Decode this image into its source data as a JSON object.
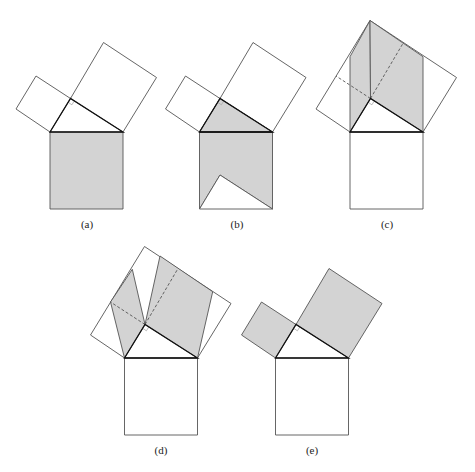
{
  "style": {
    "fill": "#d3d3d3",
    "square_stroke": "#555555",
    "triangle_stroke": "#111111",
    "dash_stroke": "#555555",
    "marker_stroke": "#aaaaaa"
  },
  "base_geometry": {
    "A": [
      50,
      132
    ],
    "B": [
      123,
      132
    ],
    "C": [
      70.5,
      98.5
    ],
    "small_square": [
      [
        50,
        132
      ],
      [
        70.5,
        98.5
      ],
      [
        36,
        76
      ],
      [
        16,
        109
      ]
    ],
    "big_square": [
      [
        70.5,
        98.5
      ],
      [
        103.5,
        42.5
      ],
      [
        156.5,
        77.5
      ],
      [
        123,
        132
      ]
    ],
    "bottom_square": [
      [
        50,
        132
      ],
      [
        123,
        132
      ],
      [
        123,
        209
      ],
      [
        50,
        209
      ]
    ],
    "outline_apex": [
      70,
      20.5
    ],
    "notch_triangle": [
      [
        50,
        209
      ],
      [
        70.5,
        175
      ],
      [
        123,
        209
      ]
    ],
    "c_left_parallelogram": [
      [
        50,
        132
      ],
      [
        70.5,
        98.5
      ],
      [
        70,
        20.5
      ],
      [
        50,
        56.7
      ]
    ],
    "c_right_parallelogram": [
      [
        70.5,
        98.5
      ],
      [
        123,
        132
      ],
      [
        123,
        56.7
      ],
      [
        70,
        20.5
      ]
    ],
    "d_small_parallelogram": [
      [
        50,
        132
      ],
      [
        70.5,
        98.5
      ],
      [
        57.8,
        43.3
      ],
      [
        36,
        76
      ]
    ],
    "d_big_parallelogram": [
      [
        70.5,
        98.5
      ],
      [
        123,
        132
      ],
      [
        138.2,
        65.7
      ],
      [
        85.5,
        30
      ]
    ]
  },
  "figures": [
    {
      "id": "a",
      "label": "(a)",
      "offset": [
        0,
        0
      ],
      "label_pos": [
        87,
        228
      ]
    },
    {
      "id": "b",
      "label": "(b)",
      "offset": [
        149.5,
        0
      ],
      "label_pos": [
        237,
        228
      ]
    },
    {
      "id": "c",
      "label": "(c)",
      "offset": [
        300,
        0
      ],
      "label_pos": [
        387,
        228
      ]
    },
    {
      "id": "d",
      "label": "(d)",
      "offset": [
        74.5,
        226
      ],
      "label_pos": [
        161,
        454
      ]
    },
    {
      "id": "e",
      "label": "(e)",
      "offset": [
        225.5,
        226
      ],
      "label_pos": [
        312,
        454
      ]
    }
  ]
}
